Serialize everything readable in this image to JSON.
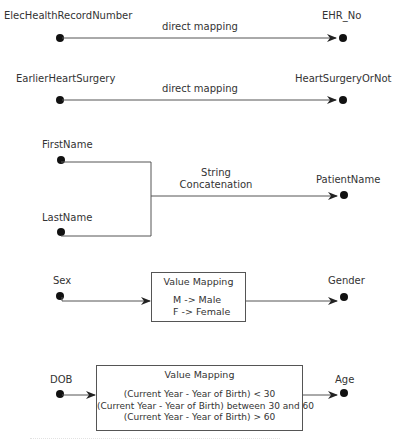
{
  "diagram": {
    "mappings": [
      {
        "id": "ehr",
        "source": "ElecHealthRecordNumber",
        "target": "EHR_No",
        "transform": "direct mapping",
        "type": "direct"
      },
      {
        "id": "surgery",
        "source": "EarlierHeartSurgery",
        "target": "HeartSurgeryOrNot",
        "transform": "direct mapping",
        "type": "direct"
      },
      {
        "id": "name",
        "sources": [
          "FirstName",
          "LastName"
        ],
        "target": "PatientName",
        "transform_line1": "String",
        "transform_line2": "Concatenation",
        "type": "concatenation"
      },
      {
        "id": "gender",
        "source": "Sex",
        "target": "Gender",
        "type": "value-mapping",
        "box_title": "Value Mapping",
        "rules": [
          "M -> Male",
          "F -> Female"
        ]
      },
      {
        "id": "age",
        "source": "DOB",
        "target": "Age",
        "type": "value-mapping",
        "box_title": "Value Mapping",
        "rules": [
          "(Current Year - Year of Birth) < 30",
          "(Current Year - Year of Birth) between 30 and 60",
          "(Current Year - Year of Birth) > 60"
        ]
      }
    ],
    "colors": {
      "line": "#555555",
      "dot": "#111111",
      "text": "#333333"
    }
  }
}
